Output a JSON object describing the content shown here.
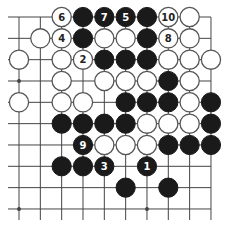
{
  "diagram": {
    "type": "go-board-partial",
    "board_size": 19,
    "view": "top-right quadrant",
    "columns_shown": 10,
    "rows_shown": 10,
    "edges": {
      "top": true,
      "right": true,
      "left": false,
      "bottom": false
    },
    "colors": {
      "line": "#444444",
      "black_stone": "#1a1a1a",
      "white_stone": "#ffffff",
      "white_outline": "#555555",
      "label_on_black": "#ffffff",
      "label_on_white": "#222222"
    },
    "star_points": [
      {
        "col": 0,
        "row": 3
      },
      {
        "col": 0,
        "row": 9
      },
      {
        "col": 6,
        "row": 9
      }
    ],
    "stones": [
      {
        "col": 2,
        "row": 0,
        "color": "white",
        "label": "6"
      },
      {
        "col": 3,
        "row": 0,
        "color": "black",
        "label": ""
      },
      {
        "col": 4,
        "row": 0,
        "color": "black",
        "label": "7"
      },
      {
        "col": 5,
        "row": 0,
        "color": "black",
        "label": "5"
      },
      {
        "col": 6,
        "row": 0,
        "color": "black",
        "label": ""
      },
      {
        "col": 7,
        "row": 0,
        "color": "white",
        "label": "10"
      },
      {
        "col": 8,
        "row": 0,
        "color": "white",
        "label": ""
      },
      {
        "col": 1,
        "row": 1,
        "color": "white",
        "label": ""
      },
      {
        "col": 2,
        "row": 1,
        "color": "white",
        "label": "4"
      },
      {
        "col": 3,
        "row": 1,
        "color": "black",
        "label": ""
      },
      {
        "col": 4,
        "row": 1,
        "color": "white",
        "label": ""
      },
      {
        "col": 5,
        "row": 1,
        "color": "white",
        "label": ""
      },
      {
        "col": 6,
        "row": 1,
        "color": "black",
        "label": ""
      },
      {
        "col": 7,
        "row": 1,
        "color": "white",
        "label": "8"
      },
      {
        "col": 8,
        "row": 1,
        "color": "white",
        "label": ""
      },
      {
        "col": 0,
        "row": 2,
        "color": "white",
        "label": ""
      },
      {
        "col": 2,
        "row": 2,
        "color": "white",
        "label": ""
      },
      {
        "col": 3,
        "row": 2,
        "color": "white",
        "label": "2"
      },
      {
        "col": 4,
        "row": 2,
        "color": "black",
        "label": ""
      },
      {
        "col": 5,
        "row": 2,
        "color": "black",
        "label": ""
      },
      {
        "col": 6,
        "row": 2,
        "color": "black",
        "label": ""
      },
      {
        "col": 7,
        "row": 2,
        "color": "white",
        "label": ""
      },
      {
        "col": 8,
        "row": 2,
        "color": "white",
        "label": ""
      },
      {
        "col": 9,
        "row": 2,
        "color": "white",
        "label": ""
      },
      {
        "col": 2,
        "row": 3,
        "color": "white",
        "label": ""
      },
      {
        "col": 4,
        "row": 3,
        "color": "white",
        "label": ""
      },
      {
        "col": 5,
        "row": 3,
        "color": "white",
        "label": ""
      },
      {
        "col": 6,
        "row": 3,
        "color": "white",
        "label": ""
      },
      {
        "col": 7,
        "row": 3,
        "color": "black",
        "label": ""
      },
      {
        "col": 8,
        "row": 3,
        "color": "white",
        "label": ""
      },
      {
        "col": 0,
        "row": 4,
        "color": "white",
        "label": ""
      },
      {
        "col": 2,
        "row": 4,
        "color": "white",
        "label": ""
      },
      {
        "col": 3,
        "row": 4,
        "color": "white",
        "label": ""
      },
      {
        "col": 5,
        "row": 4,
        "color": "black",
        "label": ""
      },
      {
        "col": 6,
        "row": 4,
        "color": "black",
        "label": ""
      },
      {
        "col": 7,
        "row": 4,
        "color": "black",
        "label": ""
      },
      {
        "col": 8,
        "row": 4,
        "color": "white",
        "label": ""
      },
      {
        "col": 9,
        "row": 4,
        "color": "black",
        "label": ""
      },
      {
        "col": 2,
        "row": 5,
        "color": "black",
        "label": ""
      },
      {
        "col": 3,
        "row": 5,
        "color": "black",
        "label": ""
      },
      {
        "col": 4,
        "row": 5,
        "color": "black",
        "label": ""
      },
      {
        "col": 5,
        "row": 5,
        "color": "black",
        "label": ""
      },
      {
        "col": 6,
        "row": 5,
        "color": "white",
        "label": ""
      },
      {
        "col": 7,
        "row": 5,
        "color": "white",
        "label": ""
      },
      {
        "col": 8,
        "row": 5,
        "color": "white",
        "label": ""
      },
      {
        "col": 9,
        "row": 5,
        "color": "black",
        "label": ""
      },
      {
        "col": 3,
        "row": 6,
        "color": "black",
        "label": "9"
      },
      {
        "col": 4,
        "row": 6,
        "color": "white",
        "label": ""
      },
      {
        "col": 5,
        "row": 6,
        "color": "white",
        "label": ""
      },
      {
        "col": 6,
        "row": 6,
        "color": "white",
        "label": ""
      },
      {
        "col": 7,
        "row": 6,
        "color": "black",
        "label": ""
      },
      {
        "col": 8,
        "row": 6,
        "color": "black",
        "label": ""
      },
      {
        "col": 9,
        "row": 6,
        "color": "black",
        "label": ""
      },
      {
        "col": 2,
        "row": 7,
        "color": "black",
        "label": ""
      },
      {
        "col": 3,
        "row": 7,
        "color": "black",
        "label": ""
      },
      {
        "col": 4,
        "row": 7,
        "color": "black",
        "label": "3"
      },
      {
        "col": 6,
        "row": 7,
        "color": "black",
        "label": "1"
      },
      {
        "col": 5,
        "row": 8,
        "color": "black",
        "label": ""
      },
      {
        "col": 7,
        "row": 8,
        "color": "black",
        "label": ""
      }
    ]
  }
}
